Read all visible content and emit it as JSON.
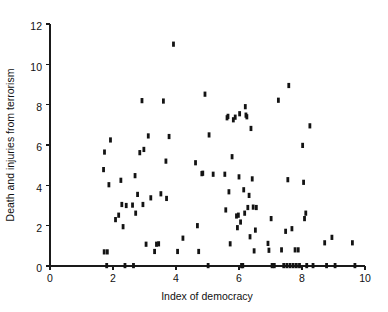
{
  "chart": {
    "type": "scatter",
    "title": "",
    "xlabel": "Index of democracy",
    "ylabel": "Death and injuries from terrorism"
  },
  "axes": {
    "x_ticks": [
      "0",
      "2",
      "4",
      "6",
      "8",
      "10"
    ],
    "y_ticks": [
      "0",
      "2",
      "4",
      "6",
      "8",
      "10",
      "12"
    ],
    "x_tick_values": [
      0,
      2,
      4,
      6,
      8,
      10
    ],
    "y_tick_values": [
      0,
      2,
      4,
      6,
      8,
      10,
      12
    ]
  },
  "chart_data": {
    "type": "scatter",
    "title": "",
    "xlabel": "Index of democracy",
    "ylabel": "Death and injuries from terrorism",
    "xlim": [
      0,
      10
    ],
    "ylim": [
      0,
      12
    ],
    "xticks": [
      0,
      2,
      4,
      6,
      8,
      10
    ],
    "yticks": [
      0,
      2,
      4,
      6,
      8,
      10,
      12
    ],
    "grid": false,
    "legend": null,
    "marker_color": "#131313",
    "series": [
      {
        "name": "countries",
        "points": [
          [
            1.7,
            4.78
          ],
          [
            1.73,
            5.65
          ],
          [
            1.72,
            0.7
          ],
          [
            1.82,
            0.7
          ],
          [
            1.8,
            0.02
          ],
          [
            1.87,
            4.03
          ],
          [
            1.92,
            6.25
          ],
          [
            2.08,
            2.3
          ],
          [
            2.18,
            2.52
          ],
          [
            2.25,
            4.25
          ],
          [
            2.28,
            3.05
          ],
          [
            2.32,
            1.95
          ],
          [
            2.38,
            0.02
          ],
          [
            2.42,
            3.0
          ],
          [
            2.62,
            3.02
          ],
          [
            2.65,
            0.02
          ],
          [
            2.7,
            4.48
          ],
          [
            2.72,
            2.62
          ],
          [
            2.78,
            3.55
          ],
          [
            2.85,
            5.62
          ],
          [
            2.92,
            8.2
          ],
          [
            2.95,
            3.05
          ],
          [
            2.98,
            5.78
          ],
          [
            3.05,
            1.08
          ],
          [
            3.12,
            6.45
          ],
          [
            3.2,
            3.38
          ],
          [
            3.32,
            0.72
          ],
          [
            3.38,
            1.08
          ],
          [
            3.45,
            1.1
          ],
          [
            3.52,
            3.58
          ],
          [
            3.6,
            8.18
          ],
          [
            3.68,
            5.2
          ],
          [
            3.7,
            3.35
          ],
          [
            3.78,
            6.42
          ],
          [
            3.92,
            11.0
          ],
          [
            4.05,
            0.72
          ],
          [
            4.22,
            1.38
          ],
          [
            4.62,
            5.12
          ],
          [
            4.68,
            2.0
          ],
          [
            4.72,
            0.72
          ],
          [
            4.82,
            4.58
          ],
          [
            4.85,
            4.6
          ],
          [
            4.92,
            8.52
          ],
          [
            5.02,
            0.02
          ],
          [
            5.05,
            6.5
          ],
          [
            5.18,
            4.55
          ],
          [
            5.55,
            4.55
          ],
          [
            5.58,
            2.78
          ],
          [
            5.62,
            7.35
          ],
          [
            5.65,
            7.42
          ],
          [
            5.68,
            3.68
          ],
          [
            5.72,
            1.1
          ],
          [
            5.78,
            5.42
          ],
          [
            5.82,
            7.25
          ],
          [
            5.88,
            7.38
          ],
          [
            5.92,
            2.48
          ],
          [
            5.95,
            1.9
          ],
          [
            5.98,
            2.52
          ],
          [
            6.0,
            4.42
          ],
          [
            6.02,
            7.55
          ],
          [
            6.05,
            2.18
          ],
          [
            6.08,
            0.02
          ],
          [
            6.12,
            0.02
          ],
          [
            6.15,
            3.78
          ],
          [
            6.18,
            2.62
          ],
          [
            6.2,
            7.9
          ],
          [
            6.22,
            7.48
          ],
          [
            6.25,
            7.4
          ],
          [
            6.28,
            2.9
          ],
          [
            6.32,
            3.5
          ],
          [
            6.35,
            1.45
          ],
          [
            6.38,
            6.82
          ],
          [
            6.42,
            4.32
          ],
          [
            6.45,
            2.92
          ],
          [
            6.48,
            0.75
          ],
          [
            6.52,
            1.78
          ],
          [
            6.55,
            2.9
          ],
          [
            6.92,
            1.12
          ],
          [
            6.95,
            0.78
          ],
          [
            7.02,
            2.35
          ],
          [
            7.05,
            0.02
          ],
          [
            7.12,
            0.02
          ],
          [
            7.25,
            8.22
          ],
          [
            7.35,
            0.8
          ],
          [
            7.42,
            0.02
          ],
          [
            7.48,
            1.72
          ],
          [
            7.52,
            0.02
          ],
          [
            7.55,
            4.28
          ],
          [
            7.58,
            8.95
          ],
          [
            7.62,
            0.02
          ],
          [
            7.68,
            1.85
          ],
          [
            7.72,
            0.02
          ],
          [
            7.78,
            0.8
          ],
          [
            7.82,
            0.02
          ],
          [
            7.88,
            0.8
          ],
          [
            7.92,
            0.02
          ],
          [
            8.02,
            5.98
          ],
          [
            8.05,
            4.15
          ],
          [
            8.08,
            2.35
          ],
          [
            8.12,
            2.62
          ],
          [
            8.15,
            0.02
          ],
          [
            8.25,
            6.95
          ],
          [
            8.35,
            0.02
          ],
          [
            8.72,
            1.15
          ],
          [
            8.78,
            0.02
          ],
          [
            8.95,
            1.42
          ],
          [
            9.05,
            0.02
          ],
          [
            9.6,
            1.15
          ],
          [
            9.68,
            0.02
          ]
        ]
      }
    ]
  },
  "plot_geometry": {
    "x_pixel_origin": 50,
    "x_pixel_end": 365,
    "y_pixel_origin": 266,
    "y_pixel_top": 24
  }
}
